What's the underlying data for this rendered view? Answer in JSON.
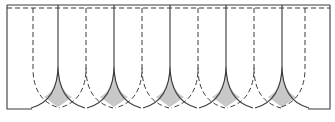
{
  "diagram": {
    "title": "",
    "colors": {
      "line": "#3a3a3a",
      "shade": "#c8c8c8",
      "background": "#ffffff"
    },
    "frame": {
      "left_x": 7,
      "right_x": 330,
      "top_solid_y": 5,
      "top_dashed_y": 8,
      "bottom_y": 109
    },
    "solid_seams_x": [
      58,
      114,
      170,
      226,
      282
    ],
    "dashed_seams_x": [
      33,
      86,
      142,
      198,
      254,
      305
    ],
    "seam_curve_start_y": 65,
    "dashed_curve_start_y": 68,
    "half_span": 27,
    "shaded_lens_count": 5
  }
}
